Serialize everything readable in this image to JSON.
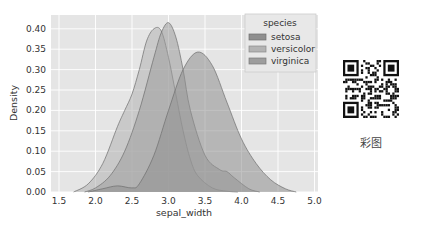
{
  "chart_data": {
    "type": "area",
    "subtype": "kde",
    "title": "",
    "xlabel": "sepal_width",
    "ylabel": "Density",
    "xlim": [
      1.35,
      5.05
    ],
    "ylim": [
      0,
      0.42
    ],
    "xticks": [
      "1.5",
      "2.0",
      "2.5",
      "3.0",
      "3.5",
      "4.0",
      "4.5",
      "5.0"
    ],
    "yticks": [
      "0.00",
      "0.05",
      "0.10",
      "0.15",
      "0.20",
      "0.25",
      "0.30",
      "0.35",
      "0.40"
    ],
    "grid": true,
    "legend": {
      "title": "species",
      "position": "upper right",
      "entries": [
        "setosa",
        "versicolor",
        "virginica"
      ]
    },
    "series": [
      {
        "name": "setosa",
        "x": [
          1.9,
          2.1,
          2.3,
          2.5,
          2.6,
          2.8,
          3.0,
          3.2,
          3.4,
          3.6,
          3.8,
          4.0,
          4.2,
          4.4,
          4.6,
          4.75
        ],
        "y": [
          0.0,
          0.008,
          0.015,
          0.01,
          0.02,
          0.09,
          0.2,
          0.3,
          0.343,
          0.31,
          0.22,
          0.13,
          0.07,
          0.03,
          0.008,
          0.0
        ]
      },
      {
        "name": "versicolor",
        "x": [
          1.7,
          1.9,
          2.1,
          2.3,
          2.4,
          2.5,
          2.6,
          2.7,
          2.8,
          2.9,
          3.0,
          3.1,
          3.2,
          3.3,
          3.4,
          3.6,
          3.8,
          3.95
        ],
        "y": [
          0.0,
          0.02,
          0.07,
          0.16,
          0.2,
          0.24,
          0.3,
          0.37,
          0.4,
          0.395,
          0.33,
          0.24,
          0.15,
          0.08,
          0.04,
          0.01,
          0.002,
          0.0
        ]
      },
      {
        "name": "virginica",
        "x": [
          1.85,
          2.0,
          2.2,
          2.4,
          2.6,
          2.8,
          2.9,
          3.0,
          3.1,
          3.2,
          3.3,
          3.5,
          3.7,
          3.8,
          3.9,
          4.1,
          4.25
        ],
        "y": [
          0.0,
          0.01,
          0.04,
          0.1,
          0.2,
          0.33,
          0.39,
          0.415,
          0.38,
          0.3,
          0.2,
          0.09,
          0.055,
          0.05,
          0.035,
          0.008,
          0.0
        ]
      }
    ],
    "colors": {
      "plot_bg": "#e5e5e5",
      "grid": "#ffffff",
      "setosa_fill": "#8f8f8f",
      "versicolor_fill": "#b3b3b3",
      "virginica_fill": "#9d9d9d",
      "edge": "#6f6f6f"
    }
  },
  "side_panel": {
    "qr_code": "qr-code",
    "caption": "彩图"
  }
}
